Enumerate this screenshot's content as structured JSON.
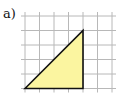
{
  "label": "a)",
  "grid": {
    "origin_x": 25,
    "origin_y": 16,
    "cell": 14.5,
    "cols": 6,
    "rows": 5,
    "line_color": "#b8b8b8"
  },
  "triangle": {
    "vertices_cells": [
      [
        0,
        5
      ],
      [
        4,
        1
      ],
      [
        4,
        5
      ]
    ],
    "fill": "#fbf5a0",
    "stroke": "#111111"
  }
}
